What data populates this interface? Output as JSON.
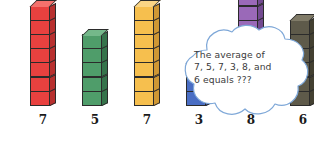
{
  "image": {
    "title": "Averaging cube towers with thought bubble",
    "background_color": "#ffffff"
  },
  "chart_data": {
    "type": "bar",
    "title": "",
    "xlabel": "",
    "ylabel": "",
    "categories": [
      "7",
      "5",
      "7",
      "3",
      "8",
      "6"
    ],
    "values": [
      7,
      5,
      7,
      3,
      8,
      6
    ],
    "ylim": [
      0,
      8
    ],
    "grid": false,
    "legend": "none",
    "unit": "cubes",
    "note": "Each bar is an isometric tower of unit cubes; the label under each tower states its height.",
    "bars": [
      {
        "label": "7",
        "value": 7,
        "color": "#e8413f",
        "top_color": "#f4716c",
        "side_color": "#b8302f"
      },
      {
        "label": "5",
        "value": 5,
        "color": "#4f9d6a",
        "top_color": "#74b88a",
        "side_color": "#35734b"
      },
      {
        "label": "7",
        "value": 7,
        "color": "#f6bf4e",
        "top_color": "#fad585",
        "side_color": "#cf9734"
      },
      {
        "label": "3",
        "value": 3,
        "color": "#4a6ec4",
        "top_color": "#7a96d8",
        "side_color": "#33509b"
      },
      {
        "label": "8",
        "value": 8,
        "color": "#9a69b8",
        "top_color": "#b992cf",
        "side_color": "#734a91"
      },
      {
        "label": "6",
        "value": 6,
        "color": "#5e5a4a",
        "top_color": "#807b68",
        "side_color": "#434031"
      }
    ]
  },
  "bubble": {
    "text": "The average of\n7, 5, 7, 3, 8, and\n6 equals ???",
    "outline_color": "#7fa8d8",
    "fill_color": "#ffffff",
    "text_color": "#3b3b3b"
  }
}
